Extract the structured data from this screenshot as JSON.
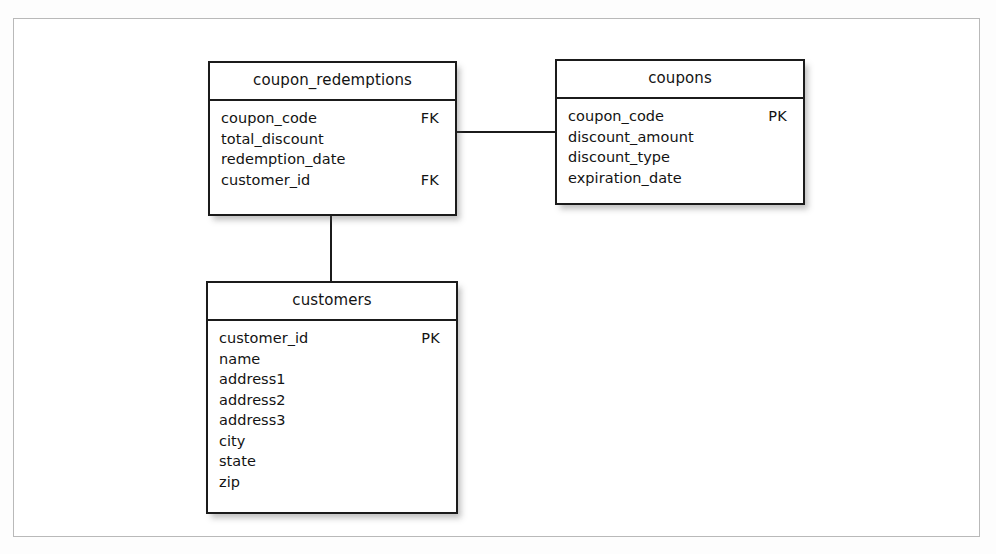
{
  "diagram": {
    "type": "entity-relationship-diagram",
    "background_color": "#ffffff",
    "frame_border_color": "#b9b9b9",
    "entity_border_color": "#1b1b1b",
    "text_color": "#131313",
    "entities": [
      {
        "id": "coupon_redemptions",
        "title": "coupon_redemptions",
        "fields": [
          {
            "name": "coupon_code",
            "key": "FK"
          },
          {
            "name": "total_discount",
            "key": ""
          },
          {
            "name": "redemption_date",
            "key": ""
          },
          {
            "name": "customer_id",
            "key": "FK"
          }
        ]
      },
      {
        "id": "coupons",
        "title": "coupons",
        "fields": [
          {
            "name": "coupon_code",
            "key": "PK"
          },
          {
            "name": "discount_amount",
            "key": ""
          },
          {
            "name": "discount_type",
            "key": ""
          },
          {
            "name": "expiration_date",
            "key": ""
          }
        ]
      },
      {
        "id": "customers",
        "title": "customers",
        "fields": [
          {
            "name": "customer_id",
            "key": "PK"
          },
          {
            "name": "name",
            "key": ""
          },
          {
            "name": "address1",
            "key": ""
          },
          {
            "name": "address2",
            "key": ""
          },
          {
            "name": "address3",
            "key": ""
          },
          {
            "name": "city",
            "key": ""
          },
          {
            "name": "state",
            "key": ""
          },
          {
            "name": "zip",
            "key": ""
          }
        ]
      }
    ],
    "relationships": [
      {
        "id": "redemptions-coupons",
        "from": "coupon_redemptions",
        "to": "coupons",
        "orientation": "horizontal"
      },
      {
        "id": "redemptions-customers",
        "from": "coupon_redemptions",
        "to": "customers",
        "orientation": "vertical"
      }
    ]
  }
}
